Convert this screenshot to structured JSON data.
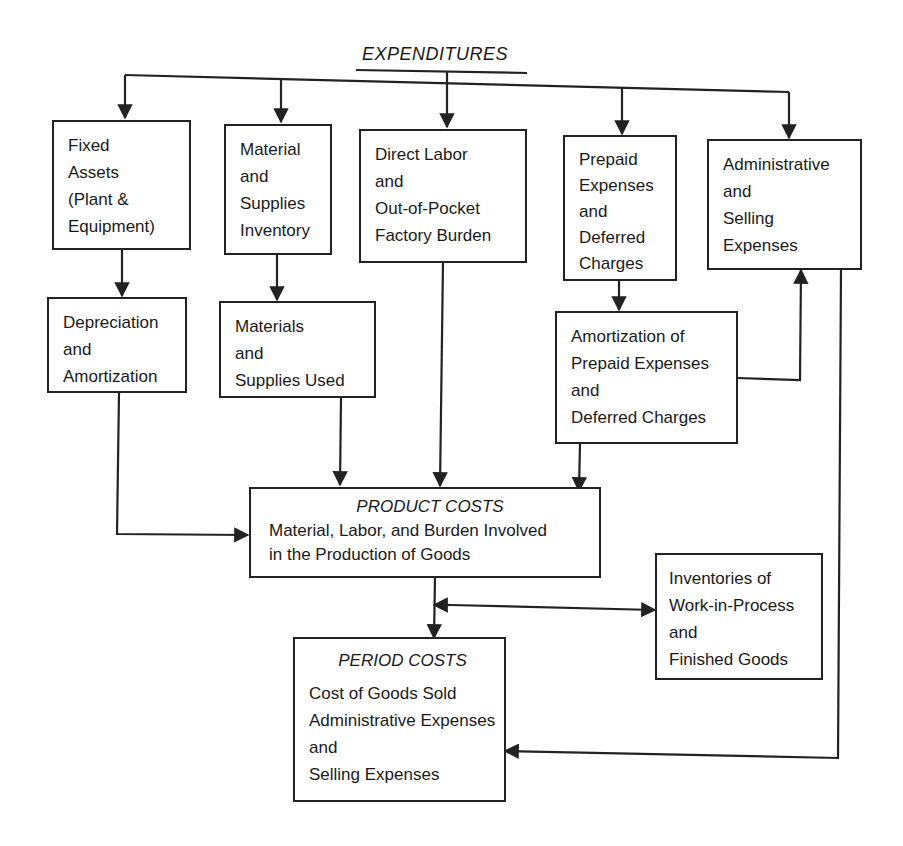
{
  "diagram": {
    "title": "EXPENDITURES",
    "row1": [
      {
        "id": "fixed-assets",
        "lines": [
          "Fixed",
          "Assets",
          "(Plant &",
          "Equipment)"
        ]
      },
      {
        "id": "material-supplies-inventory",
        "lines": [
          "Material",
          "and",
          "Supplies",
          "Inventory"
        ]
      },
      {
        "id": "direct-labor",
        "lines": [
          "Direct Labor",
          "and",
          "Out-of-Pocket",
          "Factory Burden"
        ]
      },
      {
        "id": "prepaid-expenses",
        "lines": [
          "Prepaid",
          "Expenses",
          "and",
          "Deferred",
          "Charges"
        ]
      },
      {
        "id": "admin-selling",
        "lines": [
          "Administrative",
          "and",
          "Selling",
          "Expenses"
        ]
      }
    ],
    "row2": [
      {
        "id": "depreciation",
        "lines": [
          "Depreciation",
          "and",
          "Amortization"
        ]
      },
      {
        "id": "materials-used",
        "lines": [
          "Materials",
          "and",
          "Supplies Used"
        ]
      },
      {
        "id": "amortization-prepaid",
        "lines": [
          "Amortization of",
          "Prepaid Expenses",
          "and",
          "Deferred Charges"
        ]
      }
    ],
    "product_costs": {
      "heading": "PRODUCT COSTS",
      "lines": [
        "Material, Labor, and Burden Involved",
        "in the Production of Goods"
      ]
    },
    "inventories": {
      "lines": [
        "Inventories of",
        "Work-in-Process",
        "and",
        "Finished Goods"
      ]
    },
    "period_costs": {
      "heading": "PERIOD COSTS",
      "lines": [
        "Cost of Goods Sold",
        "Administrative Expenses",
        "and",
        "Selling Expenses"
      ]
    }
  }
}
